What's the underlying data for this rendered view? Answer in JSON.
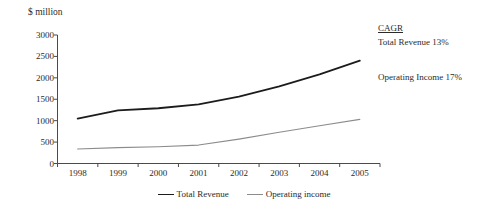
{
  "chart_data": {
    "type": "line",
    "title": "",
    "xlabel": "",
    "ylabel": "$ million",
    "categories": [
      "1998",
      "1999",
      "2000",
      "2001",
      "2002",
      "2003",
      "2004",
      "2005"
    ],
    "x": [
      1998,
      1999,
      2000,
      2001,
      2002,
      2003,
      2004,
      2005
    ],
    "ylim": [
      0,
      3000
    ],
    "yticks": [
      0,
      500,
      1000,
      1500,
      2000,
      2500,
      3000
    ],
    "ytick_labels": [
      "0",
      "500",
      "1000",
      "1500",
      "2000",
      "2500",
      "3000"
    ],
    "grid": false,
    "legend_position": "bottom",
    "series": [
      {
        "name": "Total Revenue",
        "color": "#1c1c1c",
        "line_width": 1.8,
        "values": [
          1050,
          1240,
          1290,
          1380,
          1560,
          1800,
          2080,
          2400
        ]
      },
      {
        "name": "Operating income",
        "color": "#8c8c8c",
        "line_width": 1.1,
        "values": [
          340,
          370,
          390,
          430,
          570,
          730,
          880,
          1030
        ]
      }
    ],
    "annotations": {
      "cagr_title": "CAGR",
      "rows": [
        "Total Revenue 13%",
        "Operating Income 17%"
      ]
    }
  },
  "legend": {
    "items": [
      {
        "label": "Total Revenue"
      },
      {
        "label": "Operating income"
      }
    ]
  }
}
